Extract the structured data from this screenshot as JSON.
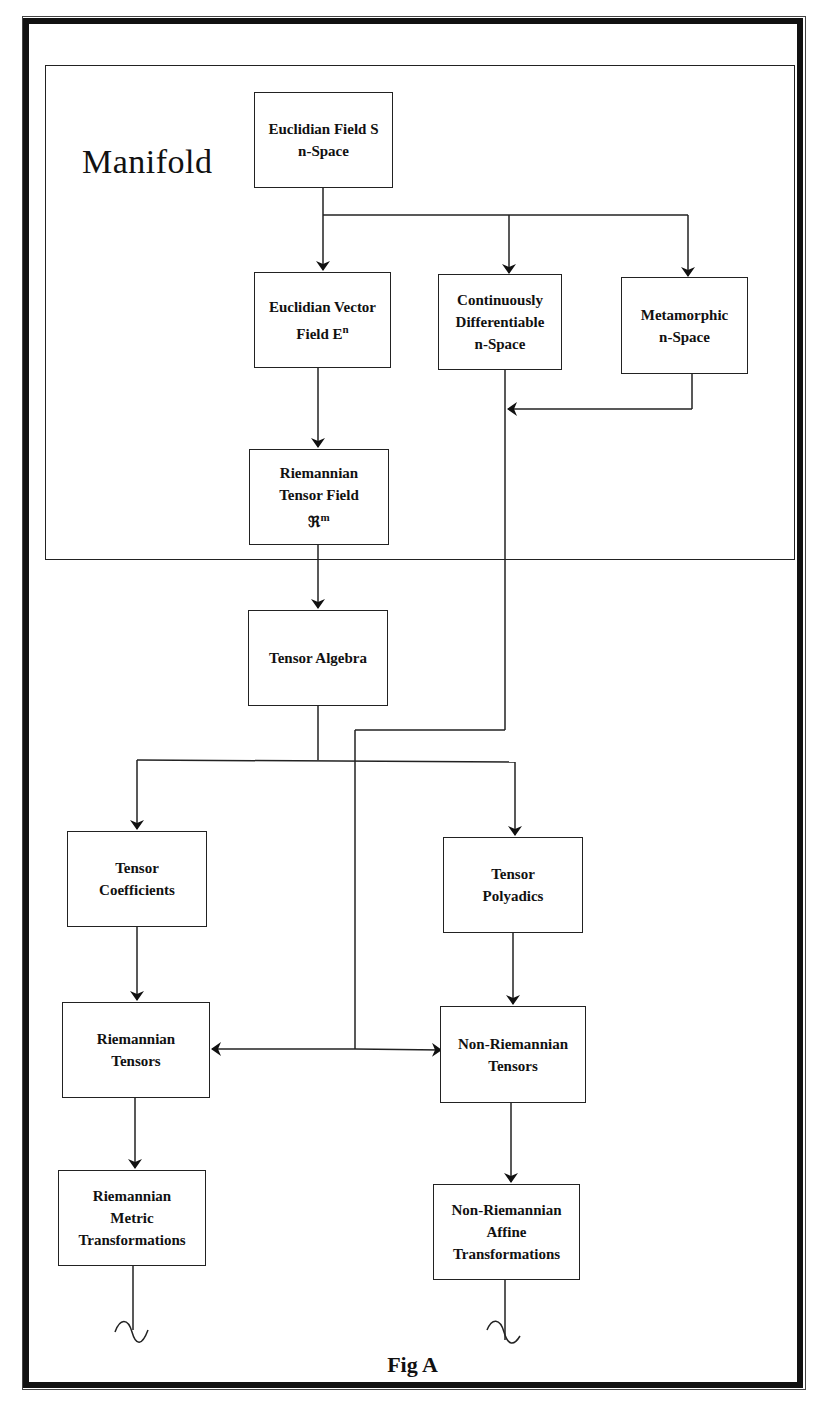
{
  "figure": {
    "caption": "Fig A",
    "group_label": "Manifold"
  },
  "nodes": {
    "euclidian_field": {
      "line1": "Euclidian Field S",
      "line2": "n-Space"
    },
    "euclidian_vector": {
      "line1": "Euclidian Vector",
      "line2": "Field  E",
      "sup": "n"
    },
    "continuously_diff": {
      "line1": "Continuously",
      "line2": "Differentiable",
      "line3": "n-Space"
    },
    "metamorphic": {
      "line1": "Metamorphic",
      "line2": "n-Space"
    },
    "riemannian_tensor_field": {
      "line1": "Riemannian",
      "line2": "Tensor Field",
      "line3": "ℜ",
      "sup": "m"
    },
    "tensor_algebra": {
      "line1": "Tensor Algebra"
    },
    "tensor_coefficients": {
      "line1": "Tensor",
      "line2": "Coefficients"
    },
    "tensor_polyadics": {
      "line1": "Tensor",
      "line2": "Polyadics"
    },
    "riemannian_tensors": {
      "line1": "Riemannian",
      "line2": "Tensors"
    },
    "non_riemannian_tensors": {
      "line1": "Non-Riemannian",
      "line2": "Tensors"
    },
    "riemannian_metric": {
      "line1": "Riemannian",
      "line2": "Metric",
      "line3": "Transformations"
    },
    "non_riemannian_affine": {
      "line1": "Non-Riemannian",
      "line2": "Affine",
      "line3": "Transformations"
    }
  },
  "edges": [
    {
      "from": "Euclidian Field S n-Space",
      "to": "Euclidian Vector Field E^n"
    },
    {
      "from": "Euclidian Field S n-Space",
      "to": "Continuously Differentiable n-Space"
    },
    {
      "from": "Euclidian Field S n-Space",
      "to": "Metamorphic n-Space"
    },
    {
      "from": "Metamorphic n-Space",
      "to": "Continuously Differentiable n-Space (line)"
    },
    {
      "from": "Euclidian Vector Field E^n",
      "to": "Riemannian Tensor Field R^m"
    },
    {
      "from": "Riemannian Tensor Field R^m",
      "to": "Tensor Algebra"
    },
    {
      "from": "Tensor Algebra",
      "to": "Tensor Coefficients"
    },
    {
      "from": "Tensor Algebra",
      "to": "Tensor Polyadics"
    },
    {
      "from": "Tensor Coefficients",
      "to": "Riemannian Tensors"
    },
    {
      "from": "Tensor Polyadics",
      "to": "Non-Riemannian Tensors"
    },
    {
      "from": "Continuously Differentiable n-Space",
      "to": "Riemannian Tensors"
    },
    {
      "from": "Continuously Differentiable n-Space",
      "to": "Non-Riemannian Tensors"
    },
    {
      "from": "Riemannian Tensors",
      "to": "Riemannian Metric Transformations"
    },
    {
      "from": "Non-Riemannian Tensors",
      "to": "Non-Riemannian Affine Transformations"
    }
  ]
}
